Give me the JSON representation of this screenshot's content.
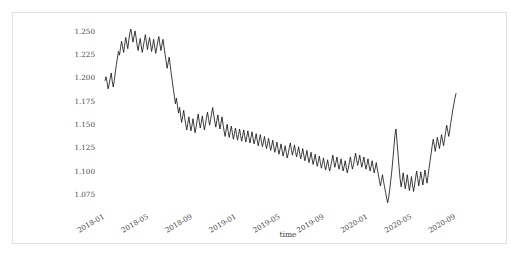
{
  "chart_data": {
    "type": "line",
    "title": "",
    "xlabel": "time",
    "ylabel": "",
    "ylim": [
      1.0625,
      1.2585
    ],
    "xlim": [
      "2018-01",
      "2020-09"
    ],
    "grid": false,
    "legend": "none",
    "line_color": "#1a1a1a",
    "y_ticks": [
      1.075,
      1.1,
      1.125,
      1.15,
      1.175,
      1.2,
      1.225,
      1.25
    ],
    "y_tick_labels": [
      "1.075",
      "1.100",
      "1.125",
      "1.150",
      "1.175",
      "1.200",
      "1.225",
      "1.250"
    ],
    "x_ticks": [
      "2018-01",
      "2018-05",
      "2018-09",
      "2019-01",
      "2019-05",
      "2019-09",
      "2020-01",
      "2020-05",
      "2020-09"
    ],
    "x_tick_labels": [
      "2018-01",
      "2018-05",
      "2018-09",
      "2019-01",
      "2019-05",
      "2019-09",
      "2020-01",
      "2020-05",
      "2020-09"
    ],
    "series": [
      {
        "name": "exchange_rate",
        "x_start": "2018-01",
        "x_end": "2020-09",
        "values": [
          1.197,
          1.201,
          1.195,
          1.188,
          1.193,
          1.199,
          1.205,
          1.196,
          1.19,
          1.197,
          1.206,
          1.214,
          1.221,
          1.228,
          1.224,
          1.232,
          1.239,
          1.233,
          1.227,
          1.235,
          1.243,
          1.237,
          1.231,
          1.24,
          1.248,
          1.252,
          1.245,
          1.238,
          1.244,
          1.25,
          1.243,
          1.235,
          1.229,
          1.236,
          1.242,
          1.234,
          1.227,
          1.233,
          1.24,
          1.246,
          1.238,
          1.23,
          1.237,
          1.243,
          1.236,
          1.228,
          1.234,
          1.241,
          1.233,
          1.226,
          1.232,
          1.239,
          1.244,
          1.236,
          1.229,
          1.235,
          1.241,
          1.233,
          1.225,
          1.218,
          1.21,
          1.216,
          1.222,
          1.213,
          1.204,
          1.196,
          1.188,
          1.18,
          1.172,
          1.178,
          1.17,
          1.162,
          1.168,
          1.16,
          1.152,
          1.158,
          1.165,
          1.157,
          1.15,
          1.144,
          1.151,
          1.158,
          1.15,
          1.143,
          1.149,
          1.156,
          1.148,
          1.141,
          1.147,
          1.154,
          1.161,
          1.153,
          1.146,
          1.152,
          1.159,
          1.151,
          1.144,
          1.15,
          1.157,
          1.163,
          1.156,
          1.149,
          1.155,
          1.162,
          1.168,
          1.16,
          1.153,
          1.147,
          1.154,
          1.16,
          1.152,
          1.145,
          1.151,
          1.158,
          1.15,
          1.143,
          1.137,
          1.144,
          1.15,
          1.142,
          1.136,
          1.142,
          1.148,
          1.141,
          1.134,
          1.14,
          1.146,
          1.139,
          1.133,
          1.139,
          1.145,
          1.138,
          1.132,
          1.138,
          1.144,
          1.137,
          1.131,
          1.137,
          1.143,
          1.136,
          1.13,
          1.136,
          1.142,
          1.135,
          1.129,
          1.134,
          1.14,
          1.133,
          1.127,
          1.133,
          1.139,
          1.132,
          1.126,
          1.131,
          1.137,
          1.13,
          1.124,
          1.129,
          1.135,
          1.128,
          1.122,
          1.127,
          1.133,
          1.126,
          1.12,
          1.125,
          1.131,
          1.124,
          1.118,
          1.123,
          1.129,
          1.122,
          1.116,
          1.121,
          1.127,
          1.12,
          1.114,
          1.119,
          1.125,
          1.13,
          1.123,
          1.117,
          1.122,
          1.128,
          1.121,
          1.115,
          1.12,
          1.126,
          1.119,
          1.113,
          1.118,
          1.124,
          1.117,
          1.111,
          1.116,
          1.122,
          1.115,
          1.109,
          1.114,
          1.12,
          1.113,
          1.107,
          1.112,
          1.118,
          1.111,
          1.105,
          1.11,
          1.116,
          1.109,
          1.103,
          1.108,
          1.114,
          1.107,
          1.101,
          1.106,
          1.112,
          1.105,
          1.1,
          1.105,
          1.111,
          1.117,
          1.11,
          1.104,
          1.109,
          1.115,
          1.108,
          1.102,
          1.107,
          1.113,
          1.106,
          1.1,
          1.105,
          1.111,
          1.104,
          1.098,
          1.103,
          1.109,
          1.115,
          1.108,
          1.102,
          1.107,
          1.113,
          1.119,
          1.112,
          1.106,
          1.111,
          1.117,
          1.11,
          1.104,
          1.109,
          1.115,
          1.108,
          1.102,
          1.107,
          1.113,
          1.106,
          1.1,
          1.105,
          1.111,
          1.104,
          1.098,
          1.103,
          1.109,
          1.102,
          1.096,
          1.09,
          1.084,
          1.09,
          1.096,
          1.089,
          1.083,
          1.077,
          1.071,
          1.066,
          1.072,
          1.08,
          1.09,
          1.1,
          1.112,
          1.125,
          1.138,
          1.145,
          1.132,
          1.118,
          1.104,
          1.092,
          1.083,
          1.09,
          1.098,
          1.089,
          1.081,
          1.088,
          1.096,
          1.087,
          1.079,
          1.086,
          1.094,
          1.085,
          1.078,
          1.085,
          1.093,
          1.1,
          1.092,
          1.084,
          1.091,
          1.099,
          1.092,
          1.085,
          1.093,
          1.101,
          1.094,
          1.087,
          1.095,
          1.103,
          1.111,
          1.119,
          1.127,
          1.134,
          1.128,
          1.121,
          1.129,
          1.136,
          1.13,
          1.124,
          1.131,
          1.139,
          1.133,
          1.127,
          1.134,
          1.142,
          1.149,
          1.143,
          1.137,
          1.144,
          1.152,
          1.159,
          1.166,
          1.172,
          1.178,
          1.183
        ]
      }
    ]
  }
}
